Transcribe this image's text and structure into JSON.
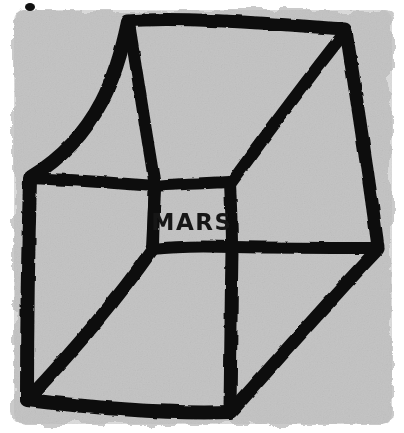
{
  "artwork": {
    "title": "MARS",
    "subject": "wireframe-cube",
    "medium": "hand-drawn ink on painted gray ground",
    "canvas": {
      "width": 404,
      "height": 433
    },
    "colors": {
      "page_background": "#ffffff",
      "ground_fill": "#cacaca",
      "ground_fill_light": "#d2d2d2",
      "ink": "#111111",
      "label_ink": "#141414"
    },
    "ground": {
      "name": "gray-painted-square",
      "left": 14,
      "top": 10,
      "right": 392,
      "bottom": 424,
      "edge_style": "rough torn brush edge"
    },
    "label": {
      "text": "MARS",
      "x": 192,
      "y": 222,
      "font_size": 23,
      "style": "hand-lettered capitals",
      "face": "inner-small-face"
    },
    "stray_mark": {
      "name": "ink-speck",
      "x": 25,
      "y": 3,
      "width": 10,
      "height": 8
    },
    "vertices": {
      "top_back_left": [
        128,
        20
      ],
      "top_back_right": [
        345,
        30
      ],
      "left_outer": [
        30,
        178
      ],
      "bottom_outer_left": [
        27,
        400
      ],
      "bottom_center": [
        230,
        413
      ],
      "right_outer": [
        378,
        248
      ],
      "face_top_left": [
        155,
        186
      ],
      "face_top_right": [
        230,
        182
      ],
      "face_bottom_right": [
        232,
        247
      ],
      "face_bottom_left": [
        152,
        249
      ]
    },
    "strokes": [
      {
        "name": "top-edge",
        "d": "M128,21 C175,16 275,24 345,29",
        "width": 13
      },
      {
        "name": "upper-left-edge",
        "d": "M128,22 C118,70 100,135 31,177",
        "width": 14
      },
      {
        "name": "left-outer-edge",
        "d": "M30,179 C28,250 27,330 27,399",
        "width": 14
      },
      {
        "name": "bottom-outer-edge",
        "d": "M27,400 C95,408 175,414 230,412",
        "width": 14
      },
      {
        "name": "right-outer-edge",
        "d": "M346,31 C356,95 370,185 378,247",
        "width": 13
      },
      {
        "name": "lower-right-edge",
        "d": "M378,249 C330,300 272,366 231,412",
        "width": 13
      },
      {
        "name": "inner-diag-top-left",
        "d": "M129,23 C137,72 146,132 155,186",
        "width": 12
      },
      {
        "name": "inner-diag-top-right",
        "d": "M345,32 C307,80 266,135 231,183",
        "width": 12
      },
      {
        "name": "inner-horiz-left",
        "d": "M31,178 C72,180 116,183 156,186",
        "width": 12
      },
      {
        "name": "inner-horiz-right",
        "d": "M233,247 C286,248 338,248 377,248",
        "width": 12
      },
      {
        "name": "inner-vert-center",
        "d": "M153,249 C154,190 155,188 155,186",
        "width": 12
      },
      {
        "name": "face-top",
        "d": "M155,186 C180,184 208,183 230,182",
        "width": 12
      },
      {
        "name": "face-right",
        "d": "M230,183 C231,205 232,228 232,247",
        "width": 12
      },
      {
        "name": "face-bottom",
        "d": "M152,249 C178,246 208,246 233,247",
        "width": 12
      },
      {
        "name": "face-left",
        "d": "M155,187 C154,208 153,230 152,249",
        "width": 12
      },
      {
        "name": "diag-lower-left",
        "d": "M152,250 C110,310 62,363 28,399",
        "width": 13
      },
      {
        "name": "vert-center-lower",
        "d": "M232,248 C231,303 231,360 230,412",
        "width": 13
      }
    ]
  }
}
